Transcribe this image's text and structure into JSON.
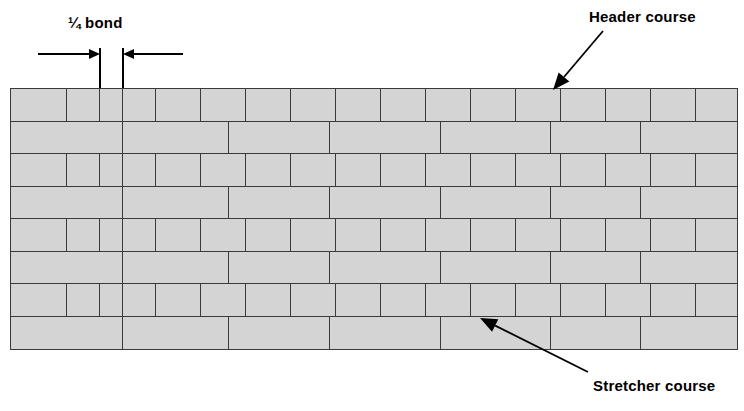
{
  "diagram": {
    "background_color": "#ffffff"
  },
  "annotations": {
    "dimension": {
      "label": "¼ bond",
      "label_x": 68,
      "label_y": 14,
      "left_ext_x": 99,
      "right_ext_x": 122,
      "ext_top_y": 48,
      "ext_bottom_y": 90,
      "arrow_y": 53,
      "left_arrow_tail_x": 38,
      "right_arrow_tail_x": 183,
      "dashed_x": 122,
      "dashed_top_y": 90,
      "dashed_bottom_y": 120
    },
    "callouts": [
      {
        "name": "header-course",
        "label": "Header course",
        "label_x": 589,
        "label_y": 8,
        "tip_x": 553,
        "tip_y": 90,
        "tail_x": 603,
        "tail_y": 31
      },
      {
        "name": "stretcher-course",
        "label": "Stretcher course",
        "label_x": 593,
        "label_y": 377,
        "tip_x": 480,
        "tip_y": 318,
        "tail_x": 588,
        "tail_y": 372
      }
    ]
  },
  "wall": {
    "x": 10,
    "y": 88,
    "width": 726,
    "height": 260,
    "course_height": 32.5,
    "brick_fill": "#d4d4d4",
    "brick_stroke": "#3a3a3a",
    "course_count": 8,
    "courses": [
      {
        "index": 1,
        "type": "header",
        "type_label": "Header course",
        "joints": [
          0,
          56,
          89,
          112,
          145,
          190,
          235,
          280,
          325,
          370,
          415,
          460,
          505,
          550,
          595,
          640,
          685,
          726
        ]
      },
      {
        "index": 2,
        "type": "stretcher",
        "type_label": "Stretcher course",
        "joints": [
          0,
          112,
          218,
          319,
          430,
          540,
          630,
          726
        ]
      },
      {
        "index": 3,
        "type": "header",
        "type_label": "Header course",
        "joints": [
          0,
          56,
          89,
          112,
          145,
          190,
          235,
          280,
          325,
          370,
          415,
          460,
          505,
          550,
          595,
          640,
          685,
          726
        ]
      },
      {
        "index": 4,
        "type": "stretcher",
        "type_label": "Stretcher course",
        "joints": [
          0,
          112,
          218,
          319,
          430,
          540,
          630,
          726
        ]
      },
      {
        "index": 5,
        "type": "header",
        "type_label": "Header course",
        "joints": [
          0,
          56,
          89,
          112,
          145,
          190,
          235,
          280,
          325,
          370,
          415,
          460,
          505,
          550,
          595,
          640,
          685,
          726
        ]
      },
      {
        "index": 6,
        "type": "stretcher",
        "type_label": "Stretcher course",
        "joints": [
          0,
          112,
          218,
          319,
          430,
          540,
          630,
          726
        ]
      },
      {
        "index": 7,
        "type": "header",
        "type_label": "Header course",
        "joints": [
          0,
          56,
          89,
          112,
          145,
          190,
          235,
          280,
          325,
          370,
          415,
          460,
          505,
          550,
          595,
          640,
          685,
          726
        ]
      },
      {
        "index": 8,
        "type": "stretcher",
        "type_label": "Stretcher course",
        "joints": [
          0,
          112,
          218,
          319,
          430,
          540,
          630,
          726
        ]
      }
    ]
  }
}
